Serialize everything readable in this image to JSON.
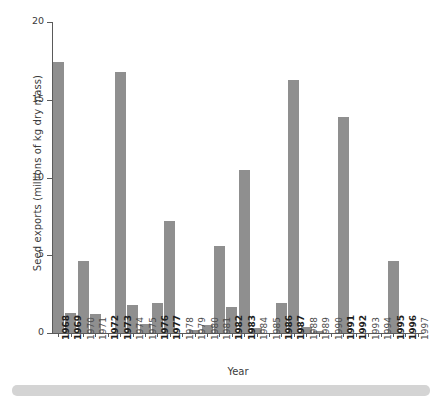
{
  "chart_data": {
    "type": "bar",
    "title": "",
    "xlabel": "Year",
    "ylabel": "Seed exports (millions of kg dry mass)",
    "ylim": [
      0,
      20
    ],
    "yticks": [
      0,
      5,
      10,
      15,
      20
    ],
    "ytick_labels": [
      "0",
      "5",
      "10",
      "15",
      "20"
    ],
    "grid": false,
    "legend": null,
    "bar_color": "#8f8f8f",
    "axis_color": "#5a5a5a",
    "categories": [
      "1968",
      "1969",
      "1970",
      "1971",
      "1972",
      "1973",
      "1974",
      "1975",
      "1976",
      "1977",
      "1978",
      "1979",
      "1980",
      "1981",
      "1982",
      "1983",
      "1984",
      "1985",
      "1986",
      "1987",
      "1988",
      "1989",
      "1990",
      "1991",
      "1992",
      "1993",
      "1994",
      "1995",
      "1996",
      "1997"
    ],
    "values": [
      17.4,
      1.3,
      4.6,
      1.2,
      0.0,
      16.8,
      1.8,
      0.6,
      1.9,
      7.2,
      0.0,
      0.2,
      0.5,
      5.6,
      1.7,
      10.5,
      0.3,
      0.0,
      1.9,
      16.3,
      0.4,
      0.15,
      0.0,
      13.9,
      0.0,
      0.0,
      0.0,
      4.6,
      0.0,
      0.0
    ],
    "emphasized_categories": [
      "1968",
      "1969",
      "1972",
      "1973",
      "1976",
      "1977",
      "1982",
      "1983",
      "1986",
      "1987",
      "1991",
      "1992",
      "1995",
      "1996"
    ]
  },
  "figure": {
    "bottom_band_color": "#d4d4d4"
  }
}
